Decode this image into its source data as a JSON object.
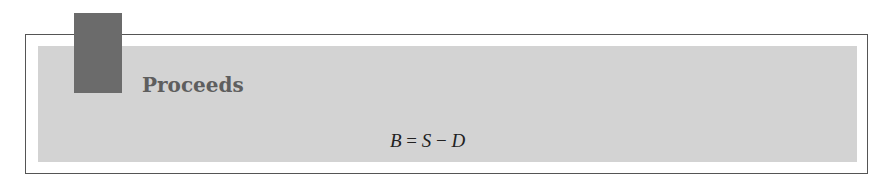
{
  "box": {
    "title": "Proceeds",
    "equation": {
      "lhs": "B",
      "op1": "=",
      "term1": "S",
      "op2": "−",
      "term2": "D"
    }
  },
  "colors": {
    "tab": "#6b6b6b",
    "panel": "#d3d3d3",
    "border": "#555555",
    "title": "#5e5e5e"
  }
}
